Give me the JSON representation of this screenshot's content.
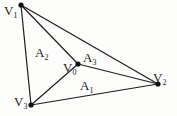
{
  "diagram": {
    "type": "triangle-barycentric-areas",
    "colors": {
      "line": "#1c1c1c",
      "vertex": "#111111",
      "background": "#fdfdfc"
    },
    "vertices": [
      {
        "id": "V0",
        "base": "V",
        "sub": "0",
        "x": 78,
        "y": 64,
        "label_x": 63,
        "label_y": 72
      },
      {
        "id": "V1",
        "base": "V",
        "sub": "1",
        "x": 21,
        "y": 5,
        "label_x": 4,
        "label_y": 15
      },
      {
        "id": "V2",
        "base": "V",
        "sub": "2",
        "x": 158,
        "y": 84,
        "label_x": 153,
        "label_y": 82
      },
      {
        "id": "V3",
        "base": "V",
        "sub": "3",
        "x": 31,
        "y": 105,
        "label_x": 14,
        "label_y": 106
      }
    ],
    "edges": [
      [
        "V1",
        "V2"
      ],
      [
        "V2",
        "V3"
      ],
      [
        "V3",
        "V1"
      ],
      [
        "V0",
        "V1"
      ],
      [
        "V0",
        "V2"
      ],
      [
        "V0",
        "V3"
      ]
    ],
    "areas": [
      {
        "id": "A1",
        "base": "A",
        "sub": "1",
        "x": 80,
        "y": 90
      },
      {
        "id": "A2",
        "base": "A",
        "sub": "2",
        "x": 35,
        "y": 57
      },
      {
        "id": "A3",
        "base": "A",
        "sub": "3",
        "x": 83,
        "y": 62
      }
    ]
  }
}
